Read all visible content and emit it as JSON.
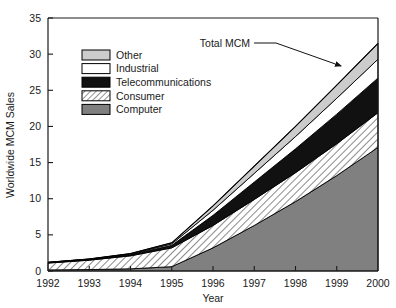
{
  "chart_data": {
    "type": "area",
    "stacked": true,
    "title": "",
    "xlabel": "Year",
    "ylabel": "Worldwide MCM Sales",
    "categories": [
      1992,
      1993,
      1994,
      1995,
      1996,
      1997,
      1998,
      1999,
      2000
    ],
    "xtick_labels": [
      "1992",
      "1993",
      "1994",
      "1995",
      "1996",
      "1997",
      "1998",
      "1999",
      "2000"
    ],
    "ytick_labels": [
      "0",
      "5",
      "10",
      "15",
      "20",
      "25",
      "30",
      "35"
    ],
    "xlim": [
      1992,
      2000
    ],
    "ylim": [
      0,
      35
    ],
    "ytick_step": 5,
    "grid": false,
    "legend_position": "upper-left-inside",
    "series": [
      {
        "name": "Computer",
        "fill": "#808080",
        "pattern": "solid-gray",
        "values": [
          0.15,
          0.2,
          0.3,
          0.6,
          3.2,
          6.3,
          9.6,
          13.2,
          17.1
        ]
      },
      {
        "name": "Consumer",
        "fill": "#ffffff",
        "pattern": "diagonal-hatch",
        "values": [
          0.95,
          1.3,
          1.8,
          2.6,
          3.1,
          3.6,
          4.0,
          4.4,
          4.8
        ]
      },
      {
        "name": "Telecommunications",
        "fill": "#111111",
        "pattern": "solid-black",
        "values": [
          0.05,
          0.08,
          0.15,
          0.35,
          1.4,
          2.4,
          3.3,
          4.1,
          4.8
        ]
      },
      {
        "name": "Industrial",
        "fill": "#ffffff",
        "pattern": "solid-white",
        "values": [
          0.03,
          0.05,
          0.08,
          0.2,
          0.7,
          1.2,
          1.7,
          2.2,
          2.6
        ]
      },
      {
        "name": "Other",
        "fill": "#cccccc",
        "pattern": "light-gray",
        "values": [
          0.02,
          0.04,
          0.07,
          0.15,
          0.6,
          1.0,
          1.4,
          1.8,
          2.2
        ]
      }
    ],
    "totals": [
      1.2,
      1.67,
      2.4,
      3.9,
      9.0,
      14.5,
      20.0,
      25.7,
      31.5
    ],
    "annotations": [
      {
        "text": "Total MCM",
        "target_x": 1999.0,
        "target_y": 30.0
      }
    ]
  },
  "legend": {
    "entries": [
      {
        "label": "Other",
        "swatch": "light-gray"
      },
      {
        "label": "Industrial",
        "swatch": "solid-white"
      },
      {
        "label": "Telecommunications",
        "swatch": "solid-black"
      },
      {
        "label": "Consumer",
        "swatch": "diagonal-hatch"
      },
      {
        "label": "Computer",
        "swatch": "solid-gray"
      }
    ]
  },
  "axes": {
    "y_title": "Worldwide MCM Sales",
    "x_title": "Year"
  },
  "annotation": {
    "total_mcm_label": "Total MCM"
  },
  "colors": {
    "other": "#cccccc",
    "industrial": "#ffffff",
    "telecommunications": "#111111",
    "consumer_fill": "#ffffff",
    "computer": "#808080",
    "axis": "#1a1a1a",
    "outline": "#000000"
  }
}
